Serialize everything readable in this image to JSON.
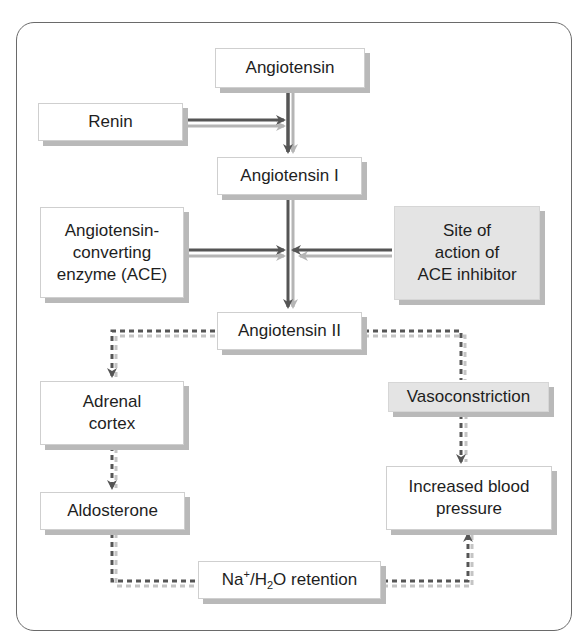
{
  "diagram": {
    "nodes": {
      "angiotensin": {
        "label": "Angiotensin"
      },
      "renin": {
        "label": "Renin"
      },
      "angiotensin_i": {
        "label": "Angiotensin I"
      },
      "ace": {
        "lines": [
          "Angiotensin-",
          "converting",
          "enzyme (ACE)"
        ]
      },
      "ace_inhibitor_site": {
        "lines": [
          "Site of",
          "action of",
          "ACE inhibitor"
        ]
      },
      "angiotensin_ii": {
        "label": "Angiotensin II"
      },
      "adrenal_cortex": {
        "lines": [
          "Adrenal",
          "cortex"
        ]
      },
      "vasoconstriction": {
        "label": "Vasoconstriction"
      },
      "aldosterone": {
        "label": "Aldosterone"
      },
      "increased_bp": {
        "lines": [
          "Increased blood",
          "pressure"
        ]
      },
      "retention": {
        "prefix": "Na",
        "sup": "+",
        "mid": "/H",
        "sub": "2",
        "suffix": "O retention"
      }
    },
    "edges": [
      {
        "from": "angiotensin",
        "to": "angiotensin_i",
        "style": "solid"
      },
      {
        "from": "renin",
        "to": "angiotensin->angiotensin_i",
        "style": "solid"
      },
      {
        "from": "angiotensin_i",
        "to": "angiotensin_ii",
        "style": "solid"
      },
      {
        "from": "ace",
        "to": "angiotensin_i->angiotensin_ii",
        "style": "solid"
      },
      {
        "from": "ace_inhibitor_site",
        "to": "angiotensin_i->angiotensin_ii",
        "style": "solid"
      },
      {
        "from": "angiotensin_ii",
        "to": "adrenal_cortex",
        "style": "dashed"
      },
      {
        "from": "angiotensin_ii",
        "to": "vasoconstriction",
        "style": "dashed"
      },
      {
        "from": "adrenal_cortex",
        "to": "aldosterone",
        "style": "dashed"
      },
      {
        "from": "vasoconstriction",
        "to": "increased_bp",
        "style": "dashed"
      },
      {
        "from": "aldosterone",
        "to": "retention",
        "style": "dashed"
      },
      {
        "from": "retention",
        "to": "increased_bp",
        "style": "dashed"
      }
    ],
    "colors": {
      "arrow": "#555555",
      "arrow_shadow": "#b5b5b5",
      "grey_box": "#e4e4e4",
      "frame": "#6a6a6a"
    }
  }
}
